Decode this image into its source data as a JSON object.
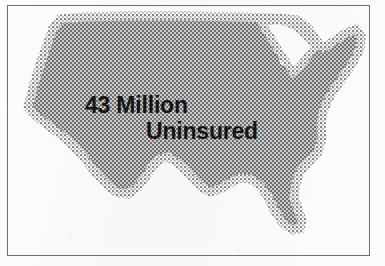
{
  "poster": {
    "type": "print-advertisement-graphic",
    "background_color": "#fbfbfa",
    "border_color": "#6e6e70"
  },
  "headline": {
    "line1": "43 Million",
    "line2": "Uninsured",
    "full_text": "43 Million Uninsured",
    "text_color": "#151515"
  },
  "map": {
    "name": "united-states-silhouette",
    "fill_color": "#737373",
    "halftone_dot_color": "#ffffff",
    "render_style": "halftone-screen",
    "region_label": "Continental United States"
  },
  "statistic": {
    "value": "43",
    "unit": "Million",
    "subject": "Uninsured"
  }
}
